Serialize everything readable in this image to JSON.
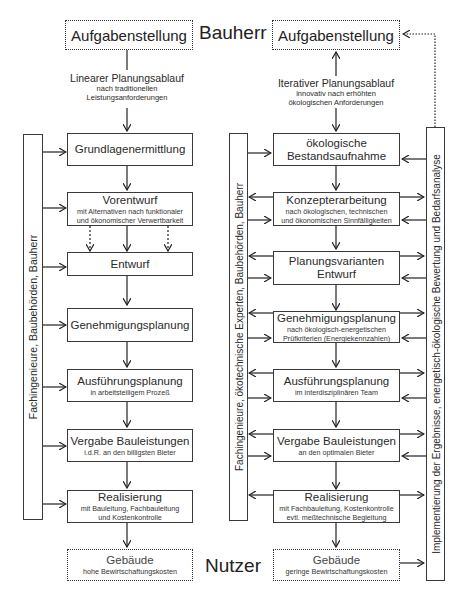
{
  "roles": {
    "top": "Bauherr",
    "bottom": "Nutzer"
  },
  "left": {
    "start": "Aufgabenstellung",
    "flow_title": "Linearer Planungsablauf",
    "flow_sub1": "nach traditionellen",
    "flow_sub2": "Leistungsanforderungen",
    "side_bar": "Fachingenieure, Baubehörden, Bauherr",
    "steps": [
      {
        "title": "Grundlagenermittlung",
        "sub1": "",
        "sub2": ""
      },
      {
        "title": "Vorentwurf",
        "sub1": "mit Alternativen nach funktionaler",
        "sub2": "und ökonomischer Verwertbarkeit"
      },
      {
        "title": "Entwurf",
        "sub1": "",
        "sub2": ""
      },
      {
        "title": "Genehmigungsplanung",
        "sub1": "",
        "sub2": ""
      },
      {
        "title": "Ausführungsplanung",
        "sub1": "in arbeitsteiligem Prozeß",
        "sub2": ""
      },
      {
        "title": "Vergabe Bauleistungen",
        "sub1": "i.d.R. an den billigsten Bieter",
        "sub2": ""
      },
      {
        "title": "Realisierung",
        "sub1": "mit Bauleitung, Fachbauleitung",
        "sub2": "und Kostenkontrolle"
      }
    ],
    "end_title": "Gebäude",
    "end_sub": "hohe Bewirtschaftungskosten"
  },
  "right": {
    "start": "Aufgabenstellung",
    "flow_title": "Iterativer Planungsablauf",
    "flow_sub1": "innovativ nach erhöhten",
    "flow_sub2": "ökologischen Anforderungen",
    "side_bar_left": "Fachingenieure, ökotechnische Experten, Baubehörden, Bauherr",
    "side_bar_right": "Implementierung der Ergebnisse, energetisch-ökologische Bewertung und Bedarfsanalyse",
    "steps": [
      {
        "title": "ökologische",
        "title2": "Bestandsaufnahme",
        "sub1": "",
        "sub2": ""
      },
      {
        "title": "Konzepterarbeitung",
        "title2": "",
        "sub1": "nach ökologischen, technischen",
        "sub2": "und ökonomischen Sinnfälligkeiten"
      },
      {
        "title": "Planungsvarianten",
        "title2": "Entwurf",
        "sub1": "",
        "sub2": ""
      },
      {
        "title": "Genehmigungsplanung",
        "title2": "",
        "sub1": "nach ökologisch-energetischen",
        "sub2": "Prüfkriterien (Energiekennzahlen)"
      },
      {
        "title": "Ausführungsplanung",
        "title2": "",
        "sub1": "im interdisziplinären Team",
        "sub2": ""
      },
      {
        "title": "Vergabe Bauleistungen",
        "title2": "",
        "sub1": "an den optimalen Bieter",
        "sub2": ""
      },
      {
        "title": "Realisierung",
        "title2": "",
        "sub1": "mit Fachbauleitung, Kostenkontrolle",
        "sub2": "evtl. meßtechnische Begleitung"
      }
    ],
    "end_title": "Gebäude",
    "end_sub": "geringe Bewirtschaftungskosten"
  }
}
